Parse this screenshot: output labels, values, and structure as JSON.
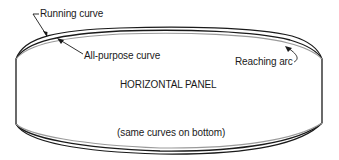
{
  "diagram": {
    "type": "panel-edge-curves",
    "labels": {
      "running_curve": "Running curve",
      "all_purpose_curve": "All-purpose curve",
      "reaching_arc": "Reaching arc",
      "panel_title": "HORIZONTAL PANEL",
      "bottom_note": "(same curves on bottom)"
    },
    "colors": {
      "ink": "#1a1a1a",
      "shadow_curve": "#9a9a9a",
      "background": "#ffffff"
    }
  }
}
